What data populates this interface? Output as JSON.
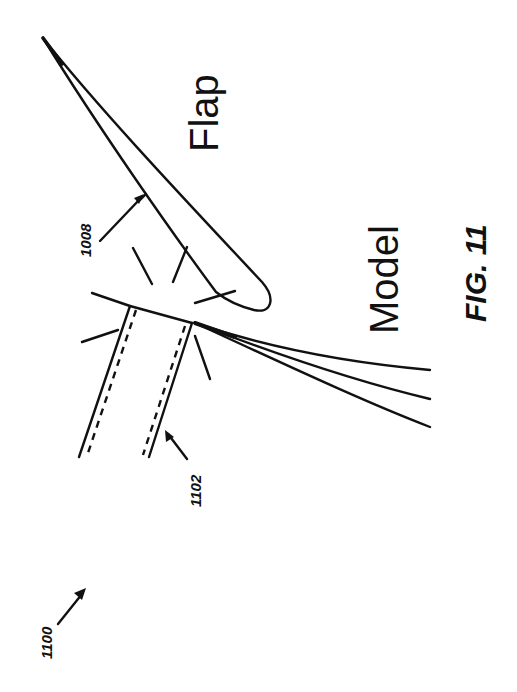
{
  "figure": {
    "title": "FIG. 11",
    "figure_ref": "1100",
    "labels": {
      "flap": "Flap",
      "model": "Model",
      "flap_ref": "1008",
      "wall_ref": "1102"
    },
    "colors": {
      "ink": "#111111",
      "paper": "#ffffff"
    }
  }
}
